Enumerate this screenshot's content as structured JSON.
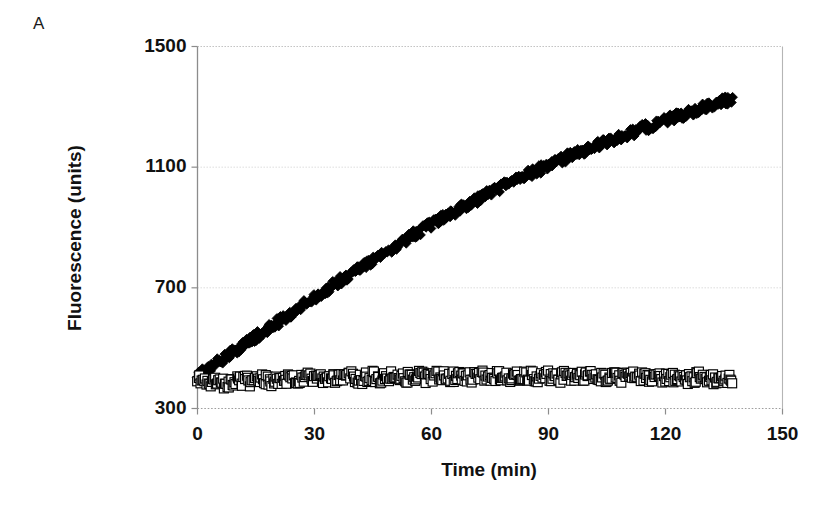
{
  "panel": {
    "label": "A"
  },
  "chart_data": {
    "type": "scatter",
    "title": "",
    "xlabel": "Time (min)",
    "ylabel": "Fluorescence (units)",
    "xlim": [
      0,
      150
    ],
    "ylim": [
      300,
      1500
    ],
    "xticks": [
      0,
      30,
      60,
      90,
      120,
      150
    ],
    "yticks": [
      300,
      700,
      1100,
      1500
    ],
    "xtick_labels": [
      "0",
      "30",
      "60",
      "90",
      "120",
      "150"
    ],
    "ytick_labels": [
      "300",
      "700",
      "1100",
      "1500"
    ],
    "grid": true,
    "grid_style": "dotted",
    "grid_color": "#d9d9d9",
    "frame_color": "#b0b0b0",
    "legend": "none",
    "legend_position": "none",
    "annotations": [],
    "series": [
      {
        "name": "filled-diamonds",
        "marker": "diamond",
        "marker_fill": "#000000",
        "marker_edge": "#000000",
        "marker_size": 7,
        "x": [
          0,
          1.4,
          2.8,
          4.2,
          5.6,
          7,
          8.4,
          9.8,
          11.2,
          12.6,
          14,
          15.4,
          16.8,
          18.2,
          19.6,
          21,
          22.4,
          23.8,
          25.2,
          26.6,
          28,
          29.4,
          30.8,
          32.2,
          33.6,
          35,
          36.4,
          37.8,
          39.2,
          40.6,
          42,
          43.4,
          44.8,
          46.2,
          47.6,
          49,
          50.4,
          51.8,
          53.2,
          54.6,
          56,
          57.4,
          58.8,
          60.2,
          61.6,
          63,
          64.4,
          65.8,
          67.2,
          68.6,
          70,
          71.4,
          72.8,
          74.2,
          75.6,
          77,
          78.4,
          79.8,
          81.2,
          82.6,
          84,
          85.4,
          86.8,
          88.2,
          89.6,
          91,
          92.4,
          93.8,
          95.2,
          96.6,
          98,
          99.4,
          100.8,
          102.2,
          103.6,
          105,
          106.4,
          107.8,
          109.2,
          110.6,
          112,
          113.4,
          114.8,
          116.2,
          117.6,
          119,
          120.4,
          121.8,
          123.2,
          124.6,
          126,
          127.4,
          128.8,
          130.2,
          131.6,
          133,
          134.4,
          135.8,
          137.2
        ],
        "y": [
          410,
          420,
          432,
          444,
          456,
          468,
          480,
          492,
          505,
          517,
          529,
          541,
          553,
          566,
          578,
          590,
          602,
          614,
          627,
          639,
          651,
          663,
          675,
          687,
          699,
          710,
          722,
          733,
          745,
          756,
          768,
          779,
          791,
          802,
          814,
          825,
          836,
          847,
          858,
          869,
          880,
          890,
          901,
          911,
          922,
          932,
          942,
          952,
          962,
          972,
          982,
          991,
          1001,
          1010,
          1019,
          1028,
          1037,
          1046,
          1055,
          1063,
          1072,
          1080,
          1088,
          1096,
          1104,
          1112,
          1120,
          1127,
          1135,
          1142,
          1150,
          1157,
          1164,
          1171,
          1178,
          1185,
          1192,
          1199,
          1205,
          1212,
          1218,
          1225,
          1231,
          1238,
          1244,
          1250,
          1257,
          1263,
          1269,
          1275,
          1281,
          1287,
          1293,
          1299,
          1305,
          1311,
          1317,
          1323,
          1330
        ]
      },
      {
        "name": "open-squares",
        "marker": "square",
        "marker_fill": "#ffffff",
        "marker_edge": "#000000",
        "marker_size": 9,
        "x": [
          0,
          1.4,
          2.8,
          4.2,
          5.6,
          7,
          8.4,
          9.8,
          11.2,
          12.6,
          14,
          15.4,
          16.8,
          18.2,
          19.6,
          21,
          22.4,
          23.8,
          25.2,
          26.6,
          28,
          29.4,
          30.8,
          32.2,
          33.6,
          35,
          36.4,
          37.8,
          39.2,
          40.6,
          42,
          43.4,
          44.8,
          46.2,
          47.6,
          49,
          50.4,
          51.8,
          53.2,
          54.6,
          56,
          57.4,
          58.8,
          60.2,
          61.6,
          63,
          64.4,
          65.8,
          67.2,
          68.6,
          70,
          71.4,
          72.8,
          74.2,
          75.6,
          77,
          78.4,
          79.8,
          81.2,
          82.6,
          84,
          85.4,
          86.8,
          88.2,
          89.6,
          91,
          92.4,
          93.8,
          95.2,
          96.6,
          98,
          99.4,
          100.8,
          102.2,
          103.6,
          105,
          106.4,
          107.8,
          109.2,
          110.6,
          112,
          113.4,
          114.8,
          116.2,
          117.6,
          119,
          120.4,
          121.8,
          123.2,
          124.6,
          126,
          127.4,
          128.8,
          130.2,
          131.6,
          133,
          134.4,
          135.8,
          137.2
        ],
        "y": [
          405,
          398,
          390,
          385,
          383,
          382,
          385,
          390,
          392,
          391,
          388,
          393,
          397,
          394,
          390,
          395,
          400,
          396,
          392,
          397,
          402,
          398,
          394,
          399,
          404,
          400,
          396,
          401,
          406,
          402,
          398,
          403,
          407,
          403,
          399,
          404,
          408,
          404,
          400,
          405,
          409,
          405,
          401,
          406,
          410,
          406,
          402,
          406,
          410,
          406,
          402,
          407,
          411,
          407,
          403,
          407,
          411,
          407,
          403,
          407,
          411,
          407,
          403,
          407,
          410,
          406,
          402,
          406,
          410,
          406,
          402,
          406,
          409,
          405,
          401,
          405,
          409,
          405,
          401,
          405,
          408,
          404,
          400,
          404,
          407,
          403,
          399,
          403,
          406,
          402,
          398,
          402,
          405,
          401,
          397,
          400,
          403,
          398,
          394
        ]
      }
    ]
  }
}
